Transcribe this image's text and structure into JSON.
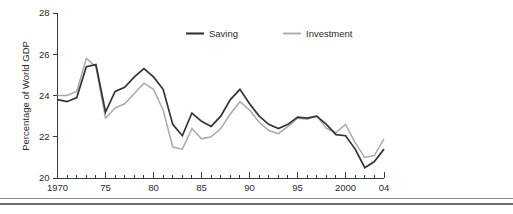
{
  "chart_data": {
    "type": "line",
    "title": "",
    "subtitle": "",
    "xlabel": "",
    "ylabel": "Percentage of  World GDP",
    "xlim": [
      1970,
      2004
    ],
    "ylim": [
      20,
      28
    ],
    "grid": false,
    "legend_position": "top-center",
    "y_ticks": [
      20,
      22,
      24,
      26,
      28
    ],
    "y_tick_labels": [
      "20",
      "22",
      "24",
      "26",
      "28"
    ],
    "x_ticks": [
      1970,
      1975,
      1980,
      1985,
      1990,
      1995,
      2000,
      2004
    ],
    "x_tick_labels": [
      "1970",
      "75",
      "80",
      "85",
      "90",
      "95",
      "2000",
      "04"
    ],
    "x_minor_tick_step": 1,
    "x": [
      1970,
      1971,
      1972,
      1973,
      1974,
      1975,
      1976,
      1977,
      1978,
      1979,
      1980,
      1981,
      1982,
      1983,
      1984,
      1985,
      1986,
      1987,
      1988,
      1989,
      1990,
      1991,
      1992,
      1993,
      1994,
      1995,
      1996,
      1997,
      1998,
      1999,
      2000,
      2001,
      2002,
      2003,
      2004
    ],
    "series": [
      {
        "name": "Saving",
        "color": "#333333",
        "values": [
          23.8,
          23.7,
          23.9,
          25.4,
          25.5,
          23.2,
          24.2,
          24.4,
          24.9,
          25.3,
          24.9,
          24.3,
          22.6,
          22.05,
          23.15,
          22.75,
          22.5,
          23.0,
          23.8,
          24.3,
          23.6,
          23.0,
          22.6,
          22.4,
          22.6,
          22.95,
          22.9,
          23.0,
          22.6,
          22.1,
          22.05,
          21.4,
          20.5,
          20.8,
          21.4
        ]
      },
      {
        "name": "Investment",
        "color": "#aaaaaa",
        "values": [
          24.0,
          24.0,
          24.2,
          25.8,
          25.4,
          22.9,
          23.4,
          23.6,
          24.1,
          24.6,
          24.3,
          23.3,
          21.5,
          21.4,
          22.4,
          21.9,
          22.0,
          22.4,
          23.1,
          23.7,
          23.3,
          22.7,
          22.3,
          22.15,
          22.5,
          22.9,
          22.85,
          23.0,
          22.4,
          22.2,
          22.6,
          21.7,
          21.0,
          21.1,
          21.9
        ]
      }
    ]
  },
  "legend": {
    "entries": [
      {
        "label": "Saving",
        "color": "#333333"
      },
      {
        "label": "Investment",
        "color": "#aaaaaa"
      }
    ]
  },
  "axes": {
    "y_axis_label": "Percentage of  World GDP"
  }
}
